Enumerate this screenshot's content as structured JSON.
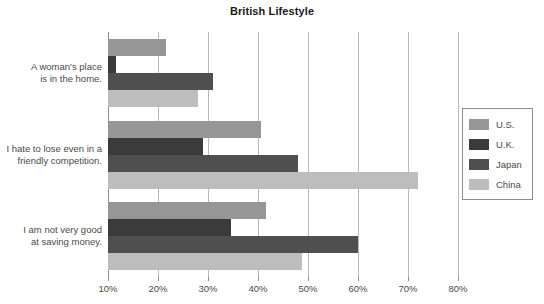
{
  "chart_data": {
    "type": "bar",
    "orientation": "horizontal",
    "title": "British Lifestyle",
    "xlabel": "",
    "ylabel": "",
    "xlim": [
      10,
      80
    ],
    "xtick_labels": [
      "10%",
      "20%",
      "30%",
      "40%",
      "50%",
      "60%",
      "70%",
      "80%"
    ],
    "xticks": [
      10,
      20,
      30,
      40,
      50,
      60,
      70,
      80
    ],
    "grid": true,
    "legend_position": "right",
    "categories": [
      "A woman's place is in the home.",
      "I hate to lose even in a friendly competition.",
      "I am not very good at saving money."
    ],
    "category_lines": [
      [
        "A woman's place",
        "is in the home."
      ],
      [
        "I hate to lose even in a",
        "friendly competition."
      ],
      [
        "I am not very good",
        "at saving money."
      ]
    ],
    "series": [
      {
        "name": "U.S.",
        "color": "#969696",
        "values": [
          21.5,
          40.5,
          41.5
        ]
      },
      {
        "name": "U.K.",
        "color": "#3b3b3b",
        "values": [
          11.5,
          29.0,
          34.5
        ]
      },
      {
        "name": "Japan",
        "color": "#4f4f4f",
        "values": [
          31.0,
          48.0,
          60.0
        ]
      },
      {
        "name": "China",
        "color": "#bdbdbd",
        "values": [
          28.0,
          72.0,
          48.7
        ]
      }
    ]
  },
  "legend": {
    "items": [
      {
        "label": "U.S."
      },
      {
        "label": "U.K."
      },
      {
        "label": "Japan"
      },
      {
        "label": "China"
      }
    ]
  },
  "axis_colors": {
    "gridline": "#b8b8b8",
    "axis": "#8f8f8f",
    "text": "#4a4a4a",
    "title": "#1a1a1a"
  }
}
